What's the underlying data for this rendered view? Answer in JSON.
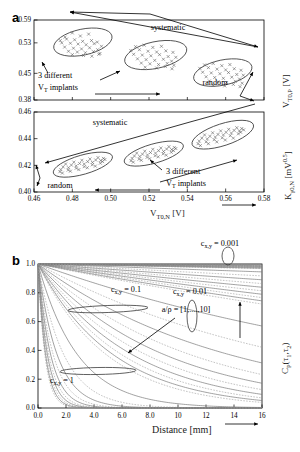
{
  "figure": {
    "panel_a_letter": "a",
    "panel_b_letter": "b"
  },
  "panel_a": {
    "top": {
      "x_range": [
        0.46,
        0.58
      ],
      "y_ticks": [
        "0.59",
        "0.53",
        "0.45",
        "0.38"
      ],
      "y_tick_values": [
        0.59,
        0.53,
        0.45,
        0.38
      ],
      "y_axis_label": "V",
      "y_axis_label_sub": "T0,P",
      "y_axis_label_unit": " [V]",
      "annotations": {
        "systematic": "systematic",
        "random": "random",
        "implants_line1": "3 different",
        "implants_line2_v": "V",
        "implants_line2_sub": "T",
        "implants_line2_rest": " implants"
      }
    },
    "bottom": {
      "x_range": [
        0.46,
        0.58
      ],
      "x_ticks": [
        "0.46",
        "0.48",
        "0.50",
        "0.52",
        "0.54",
        "0.56",
        "0.58"
      ],
      "x_tick_values": [
        0.46,
        0.48,
        0.5,
        0.52,
        0.54,
        0.56,
        0.58
      ],
      "y_ticks": [
        "0.46",
        "0.44",
        "0.42",
        "0.40"
      ],
      "y_tick_values": [
        0.46,
        0.44,
        0.42,
        0.4
      ],
      "y_axis_label": "K",
      "y_axis_label_sub": "γ0,N",
      "y_axis_label_unit": " [mV",
      "y_axis_label_sup": "0.5",
      "y_axis_label_close": "]",
      "x_axis_label": "V",
      "x_axis_label_sub": "T0,N",
      "x_axis_label_unit": " [V]",
      "annotations": {
        "systematic": "systematic",
        "random": "random",
        "implants_line1": "3 different",
        "implants_line2_v": "V",
        "implants_line2_sub": "T",
        "implants_line2_rest": " implants"
      }
    }
  },
  "chart_data": [
    {
      "type": "scatter",
      "title": "",
      "xlabel": "V_T0,N [V]",
      "ylabel": "V_T0,P [V]",
      "xlim": [
        0.46,
        0.58
      ],
      "ylim": [
        0.38,
        0.59
      ],
      "grid": false,
      "marker": "x",
      "clusters": [
        {
          "name": "implant-1",
          "ellipse": {
            "cx": 0.4855,
            "cy": 0.532,
            "rx": 0.0155,
            "ry": 0.034,
            "rotation": -12
          },
          "points": [
            [
              0.4762,
              0.545
            ],
            [
              0.48,
              0.556
            ],
            [
              0.4842,
              0.548
            ],
            [
              0.4885,
              0.553
            ],
            [
              0.4737,
              0.536
            ],
            [
              0.477,
              0.54
            ],
            [
              0.4812,
              0.538
            ],
            [
              0.4854,
              0.534
            ],
            [
              0.49,
              0.536
            ],
            [
              0.493,
              0.532
            ],
            [
              0.4745,
              0.53
            ],
            [
              0.479,
              0.529
            ],
            [
              0.483,
              0.527
            ],
            [
              0.4872,
              0.525
            ],
            [
              0.4914,
              0.528
            ],
            [
              0.4952,
              0.521
            ],
            [
              0.476,
              0.519
            ],
            [
              0.4806,
              0.516
            ],
            [
              0.4848,
              0.514
            ],
            [
              0.489,
              0.517
            ],
            [
              0.4932,
              0.512
            ],
            [
              0.478,
              0.508
            ],
            [
              0.4826,
              0.506
            ],
            [
              0.4868,
              0.504
            ],
            [
              0.491,
              0.507
            ],
            [
              0.4944,
              0.502
            ],
            [
              0.48,
              0.499
            ],
            [
              0.4858,
              0.497
            ],
            [
              0.4902,
              0.495
            ],
            [
              0.4938,
              0.5
            ]
          ]
        },
        {
          "name": "implant-2",
          "ellipse": {
            "cx": 0.5235,
            "cy": 0.498,
            "rx": 0.0165,
            "ry": 0.035,
            "rotation": -12
          },
          "points": [
            [
              0.513,
              0.52
            ],
            [
              0.5175,
              0.524
            ],
            [
              0.522,
              0.518
            ],
            [
              0.5265,
              0.521
            ],
            [
              0.5105,
              0.51
            ],
            [
              0.515,
              0.512
            ],
            [
              0.5195,
              0.508
            ],
            [
              0.524,
              0.506
            ],
            [
              0.5288,
              0.509
            ],
            [
              0.5325,
              0.505
            ],
            [
              0.512,
              0.5
            ],
            [
              0.5165,
              0.498
            ],
            [
              0.521,
              0.496
            ],
            [
              0.5255,
              0.499
            ],
            [
              0.53,
              0.494
            ],
            [
              0.534,
              0.492
            ],
            [
              0.514,
              0.488
            ],
            [
              0.5185,
              0.486
            ],
            [
              0.523,
              0.484
            ],
            [
              0.5275,
              0.487
            ],
            [
              0.5318,
              0.482
            ],
            [
              0.516,
              0.477
            ],
            [
              0.5205,
              0.475
            ],
            [
              0.525,
              0.473
            ],
            [
              0.5295,
              0.476
            ],
            [
              0.533,
              0.471
            ],
            [
              0.518,
              0.466
            ],
            [
              0.524,
              0.464
            ],
            [
              0.5285,
              0.468
            ],
            [
              0.532,
              0.462
            ]
          ]
        },
        {
          "name": "implant-3",
          "ellipse": {
            "cx": 0.5585,
            "cy": 0.452,
            "rx": 0.0155,
            "ry": 0.033,
            "rotation": -12
          },
          "points": [
            [
              0.549,
              0.472
            ],
            [
              0.5535,
              0.476
            ],
            [
              0.558,
              0.47
            ],
            [
              0.5622,
              0.473
            ],
            [
              0.5465,
              0.463
            ],
            [
              0.551,
              0.465
            ],
            [
              0.5555,
              0.461
            ],
            [
              0.56,
              0.459
            ],
            [
              0.5645,
              0.462
            ],
            [
              0.568,
              0.458
            ],
            [
              0.548,
              0.453
            ],
            [
              0.5525,
              0.451
            ],
            [
              0.557,
              0.449
            ],
            [
              0.5615,
              0.452
            ],
            [
              0.5658,
              0.447
            ],
            [
              0.5692,
              0.445
            ],
            [
              0.5498,
              0.441
            ],
            [
              0.5543,
              0.439
            ],
            [
              0.5588,
              0.437
            ],
            [
              0.5632,
              0.44
            ],
            [
              0.5672,
              0.435
            ],
            [
              0.5515,
              0.43
            ],
            [
              0.556,
              0.428
            ],
            [
              0.5605,
              0.426
            ],
            [
              0.565,
              0.429
            ],
            [
              0.5686,
              0.424
            ],
            [
              0.5535,
              0.419
            ],
            [
              0.5595,
              0.417
            ],
            [
              0.564,
              0.421
            ],
            [
              0.5675,
              0.415
            ]
          ]
        }
      ]
    },
    {
      "type": "scatter",
      "title": "",
      "xlabel": "V_T0,N [V]",
      "ylabel": "K_γ0,N [mV^0.5]",
      "xlim": [
        0.46,
        0.58
      ],
      "ylim": [
        0.4,
        0.46
      ],
      "grid": false,
      "marker": "x",
      "clusters": [
        {
          "name": "implant-1",
          "ellipse": {
            "cx": 0.4855,
            "cy": 0.4205,
            "rx": 0.016,
            "ry": 0.0072,
            "rotation": 16
          },
          "points": [
            [
              0.474,
              0.4168
            ],
            [
              0.478,
              0.4182
            ],
            [
              0.482,
              0.4196
            ],
            [
              0.4862,
              0.421
            ],
            [
              0.4905,
              0.4222
            ],
            [
              0.4948,
              0.4236
            ],
            [
              0.4752,
              0.4188
            ],
            [
              0.4795,
              0.4202
            ],
            [
              0.4838,
              0.4214
            ],
            [
              0.488,
              0.4228
            ],
            [
              0.4922,
              0.424
            ],
            [
              0.4962,
              0.4252
            ],
            [
              0.4735,
              0.4152
            ],
            [
              0.4778,
              0.4164
            ],
            [
              0.482,
              0.4178
            ],
            [
              0.4862,
              0.419
            ],
            [
              0.4904,
              0.4204
            ],
            [
              0.4946,
              0.4216
            ],
            [
              0.4765,
              0.421
            ],
            [
              0.4808,
              0.4224
            ],
            [
              0.485,
              0.4238
            ],
            [
              0.4892,
              0.4248
            ],
            [
              0.4934,
              0.4258
            ],
            [
              0.497,
              0.4244
            ],
            [
              0.4748,
              0.4142
            ],
            [
              0.479,
              0.4156
            ],
            [
              0.4834,
              0.4168
            ],
            [
              0.4878,
              0.4182
            ],
            [
              0.492,
              0.4194
            ],
            [
              0.4958,
              0.4228
            ]
          ]
        },
        {
          "name": "implant-2",
          "ellipse": {
            "cx": 0.5225,
            "cy": 0.4288,
            "rx": 0.016,
            "ry": 0.0072,
            "rotation": 16
          },
          "points": [
            [
              0.5112,
              0.4252
            ],
            [
              0.5152,
              0.4266
            ],
            [
              0.5192,
              0.4278
            ],
            [
              0.5234,
              0.4292
            ],
            [
              0.5276,
              0.4304
            ],
            [
              0.5318,
              0.4318
            ],
            [
              0.5124,
              0.427
            ],
            [
              0.5166,
              0.4284
            ],
            [
              0.5208,
              0.4296
            ],
            [
              0.525,
              0.431
            ],
            [
              0.5292,
              0.4322
            ],
            [
              0.5332,
              0.4334
            ],
            [
              0.5106,
              0.4234
            ],
            [
              0.5148,
              0.4246
            ],
            [
              0.519,
              0.426
            ],
            [
              0.5232,
              0.4272
            ],
            [
              0.5274,
              0.4286
            ],
            [
              0.5316,
              0.4298
            ],
            [
              0.5136,
              0.4292
            ],
            [
              0.5178,
              0.4306
            ],
            [
              0.522,
              0.432
            ],
            [
              0.5262,
              0.433
            ],
            [
              0.5304,
              0.434
            ],
            [
              0.534,
              0.4326
            ],
            [
              0.5118,
              0.4224
            ],
            [
              0.516,
              0.4238
            ],
            [
              0.5204,
              0.425
            ],
            [
              0.5248,
              0.4264
            ],
            [
              0.529,
              0.4276
            ],
            [
              0.5328,
              0.431
            ]
          ]
        },
        {
          "name": "implant-3",
          "ellipse": {
            "cx": 0.5585,
            "cy": 0.443,
            "rx": 0.0168,
            "ry": 0.0082,
            "rotation": 18
          },
          "points": [
            [
              0.5462,
              0.4382
            ],
            [
              0.5504,
              0.4398
            ],
            [
              0.5546,
              0.4412
            ],
            [
              0.5588,
              0.4428
            ],
            [
              0.563,
              0.4442
            ],
            [
              0.5672,
              0.4458
            ],
            [
              0.5476,
              0.4404
            ],
            [
              0.5518,
              0.4418
            ],
            [
              0.556,
              0.4432
            ],
            [
              0.5602,
              0.4448
            ],
            [
              0.5644,
              0.4462
            ],
            [
              0.5684,
              0.4476
            ],
            [
              0.5456,
              0.4362
            ],
            [
              0.5498,
              0.4376
            ],
            [
              0.554,
              0.4392
            ],
            [
              0.5582,
              0.4406
            ],
            [
              0.5624,
              0.4422
            ],
            [
              0.5666,
              0.4436
            ],
            [
              0.549,
              0.4428
            ],
            [
              0.5532,
              0.4444
            ],
            [
              0.5574,
              0.4458
            ],
            [
              0.5616,
              0.447
            ],
            [
              0.5658,
              0.4482
            ],
            [
              0.5694,
              0.4466
            ],
            [
              0.5468,
              0.4348
            ],
            [
              0.551,
              0.4362
            ],
            [
              0.5554,
              0.4376
            ],
            [
              0.5598,
              0.439
            ],
            [
              0.564,
              0.4404
            ],
            [
              0.5678,
              0.4448
            ]
          ]
        }
      ]
    },
    {
      "type": "line",
      "title": "",
      "xlabel": "Distance [mm]",
      "ylabel": "C_P(τ₁,τ₂)",
      "xlim": [
        0,
        16
      ],
      "ylim": [
        0,
        1
      ],
      "grid": false,
      "x_ticks": [
        "0.0",
        "2.0",
        "4.0",
        "6.0",
        "8.0",
        "10",
        "12",
        "14",
        "16"
      ],
      "x_tick_values": [
        0,
        2,
        4,
        6,
        8,
        10,
        12,
        14,
        16
      ],
      "y_ticks": [
        "0.0",
        "0.2",
        "0.4",
        "0.6",
        "0.8",
        "1.0"
      ],
      "y_tick_values": [
        0,
        0.2,
        0.4,
        0.6,
        0.8,
        1.0
      ],
      "families": [
        {
          "label": "c_x,y = 1",
          "c": 1,
          "a_over_rho": [
            1,
            2,
            3,
            4,
            5,
            6,
            7,
            8,
            9,
            10
          ]
        },
        {
          "label": "c_x,y = 0.1",
          "c": 0.1,
          "a_over_rho": [
            1,
            2,
            3,
            4,
            5,
            6,
            7,
            8,
            9,
            10
          ]
        },
        {
          "label": "c_x,y = 0.01",
          "c": 0.01,
          "a_over_rho": [
            1,
            2,
            3,
            4,
            5,
            6,
            7,
            8,
            9,
            10
          ]
        },
        {
          "label": "c_x,y = 0.001",
          "c": 0.001,
          "a_over_rho": [
            1,
            2,
            3,
            4,
            5,
            6,
            7,
            8,
            9,
            10
          ]
        }
      ],
      "annotation_ratio": "a/ρ  = [1,....,10]"
    }
  ],
  "panel_b": {
    "labels": {
      "c_0001_c": "c",
      "c_0001_sub": "x,y",
      "c_0001_val": " = 0.001",
      "c_001_val": " = 0.01",
      "c_01_val": " = 0.1",
      "c_1_val": " = 1",
      "ratio": "a/ρ  = [1,....,10]",
      "y_axis_c": "C",
      "y_axis_sub_p": "P",
      "y_axis_rest": "(τ",
      "y_axis_sub1": "1",
      "y_axis_mid": ",τ",
      "y_axis_sub2": "2",
      "y_axis_close": ")",
      "x_axis_label": "Distance [mm]"
    }
  }
}
